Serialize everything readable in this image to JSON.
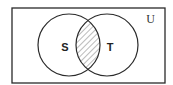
{
  "diagram": {
    "type": "venn",
    "universe": {
      "label": "U",
      "x": 12,
      "y": 8,
      "width": 153,
      "height": 75
    },
    "sets": [
      {
        "label": "S",
        "cx": 69,
        "cy": 45,
        "r": 31,
        "label_x": 65,
        "label_y": 51
      },
      {
        "label": "T",
        "cx": 107,
        "cy": 45,
        "r": 31,
        "label_x": 110,
        "label_y": 51
      }
    ],
    "shaded_region": "S ∩ T",
    "shading_pattern": "diagonal-hatch",
    "colors": {
      "stroke": "#2a2a2a",
      "hatch": "#555555",
      "background": "#ffffff"
    }
  }
}
